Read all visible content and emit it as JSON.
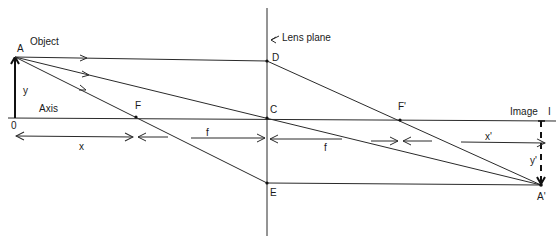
{
  "labels": {
    "A": "A",
    "object": "Object",
    "y": "y",
    "axis": "Axis",
    "origin": "0",
    "F": "F",
    "C": "C",
    "D": "D",
    "E": "E",
    "lens_plane": "Lens plane",
    "lens_plane_arrow": "←",
    "F_prime": "F'",
    "image": "Image",
    "I": "I",
    "A_prime": "A'",
    "x": "x",
    "f_left": "f",
    "f_right": "f",
    "x_prime": "x'",
    "y_prime": "y'"
  },
  "points": {
    "A": [
      15,
      57
    ],
    "O": [
      15,
      118
    ],
    "F": [
      136,
      117
    ],
    "C": [
      267,
      118
    ],
    "D": [
      267,
      61
    ],
    "E": [
      267,
      183
    ],
    "F_prime": [
      400,
      120
    ],
    "I": [
      541,
      121
    ],
    "A_prime": [
      541,
      185
    ]
  },
  "colors": {
    "line": "#2a2a2a",
    "text": "#1a1a1a",
    "background": "#ffffff"
  }
}
